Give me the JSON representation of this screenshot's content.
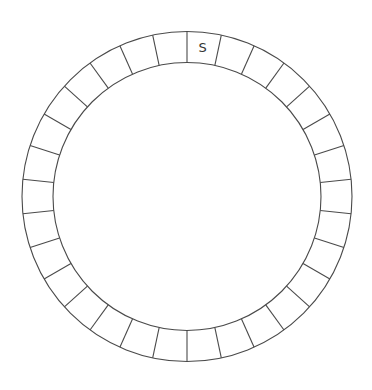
{
  "diagram": {
    "type": "segmented-ring",
    "center": [
      187,
      196.5
    ],
    "outer_radius": 165,
    "inner_radius": 134,
    "segment_count": 30,
    "start_angle_deg": 0,
    "colors": {
      "background": "#ffffff",
      "stroke": "#4a4a4a",
      "label": "#333333"
    },
    "labels": [
      {
        "segment_index": 0,
        "text": "S"
      }
    ]
  }
}
